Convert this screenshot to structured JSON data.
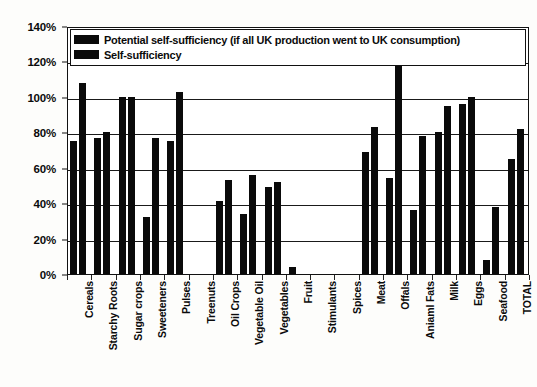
{
  "chart_data": {
    "type": "bar",
    "title": "",
    "xlabel": "",
    "ylabel": "",
    "ylim": [
      0,
      140
    ],
    "ytick_labels": [
      "0%",
      "20%",
      "40%",
      "60%",
      "80%",
      "100%",
      "120%",
      "140%"
    ],
    "ytick_values": [
      0,
      20,
      40,
      60,
      80,
      100,
      120,
      140
    ],
    "grid": true,
    "legend_position": "top-left-inside",
    "categories": [
      "Cereals",
      "Starchy Roots",
      "Sugar crops",
      "Sweeteners",
      "Pulses",
      "Treenuts",
      "Oil Crops",
      "Vegetable Oil",
      "Vegetables",
      "Fruit",
      "Stimulants",
      "Spices",
      "Meat",
      "Offals",
      "Aniaml Fats",
      "Milk",
      "Eggs",
      "Seafood",
      "TOTAL"
    ],
    "series": [
      {
        "name": "Potential self-sufficiency (if all UK production went to UK consumption)",
        "color": "#0a0a0a",
        "values": [
          75,
          77,
          100,
          32,
          75,
          0,
          41,
          34,
          49,
          4,
          0,
          0,
          69,
          54,
          36,
          80,
          96,
          8,
          65
        ]
      },
      {
        "name": "Self-sufficiency",
        "color": "#0a0a0a",
        "values": [
          108,
          80,
          100,
          77,
          103,
          0,
          53,
          56,
          52,
          0,
          0,
          0,
          83,
          127,
          78,
          95,
          100,
          38,
          82
        ]
      }
    ]
  },
  "legend": {
    "items": [
      {
        "label": "Potential self-sufficiency (if all UK production went to UK consumption)"
      },
      {
        "label": "Self-sufficiency"
      }
    ]
  }
}
